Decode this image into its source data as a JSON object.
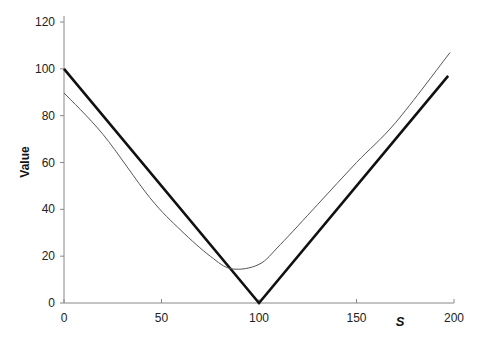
{
  "chart_data": {
    "type": "line",
    "title": "",
    "xlabel": "S",
    "ylabel": "Value",
    "xlim": [
      0,
      200
    ],
    "ylim": [
      0,
      120
    ],
    "xticks": [
      0,
      50,
      100,
      150,
      200
    ],
    "yticks": [
      0,
      20,
      40,
      60,
      80,
      100,
      120
    ],
    "grid": false,
    "legend": null,
    "series": [
      {
        "name": "payoff (thick)",
        "style": "thick",
        "color": "#111111",
        "x": [
          0,
          100,
          197
        ],
        "y": [
          100,
          0,
          97
        ]
      },
      {
        "name": "value (thin)",
        "style": "thin",
        "color": "#555555",
        "x": [
          0,
          20,
          44,
          60,
          75,
          86,
          100,
          111,
          130,
          150,
          170,
          198
        ],
        "y": [
          89.7,
          72,
          45,
          31,
          20,
          14.6,
          16.5,
          25,
          42,
          60,
          77,
          107
        ]
      }
    ]
  },
  "labels": {
    "ylabel": "Value",
    "xlabel": "S",
    "xticks": [
      "0",
      "50",
      "100",
      "150",
      "200"
    ],
    "yticks": [
      "0",
      "20",
      "40",
      "60",
      "80",
      "100",
      "120"
    ]
  }
}
